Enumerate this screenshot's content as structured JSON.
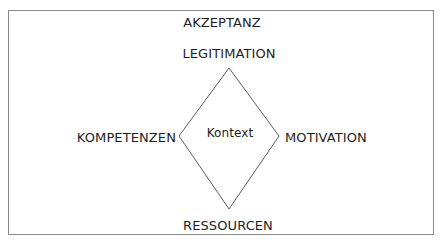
{
  "diagram": {
    "title": "AKZEPTANZ",
    "center": "Kontext",
    "top": "LEGITIMATION",
    "left": "KOMPETENZEN",
    "right": "MOTIVATION",
    "bottom": "RESSOURCEN"
  },
  "colors": {
    "frame": "#8a8a8a",
    "lines": "#5a5a5a",
    "text": "#1e1e1e",
    "background": "#ffffff"
  }
}
